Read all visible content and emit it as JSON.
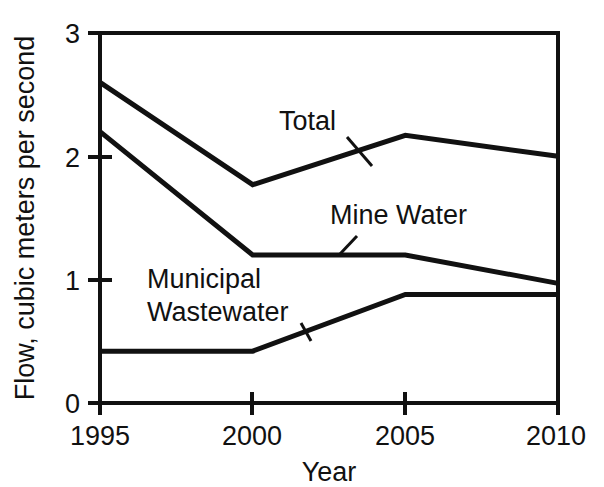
{
  "chart_data": {
    "type": "line",
    "title": "",
    "xlabel": "Year",
    "ylabel": "Flow, cubic meters per second",
    "x": [
      1995,
      2000,
      2005,
      2010
    ],
    "categories": [
      "1995",
      "2000",
      "2005",
      "2010"
    ],
    "xlim": [
      1995,
      2010
    ],
    "ylim": [
      0,
      3
    ],
    "xticks": [
      "1995",
      "2000",
      "2005",
      "2010"
    ],
    "yticks": [
      "0",
      "1",
      "2",
      "3"
    ],
    "grid": false,
    "legend_position": "inline-labels",
    "series": [
      {
        "name": "Total",
        "values": [
          2.6,
          1.77,
          2.17,
          2.0
        ]
      },
      {
        "name": "Mine Water",
        "values": [
          2.2,
          1.2,
          1.2,
          0.97
        ]
      },
      {
        "name": "Municipal Wastewater",
        "values": [
          0.42,
          0.42,
          0.88,
          0.88
        ]
      }
    ],
    "annotations": [
      {
        "text": "Total",
        "series": "Total"
      },
      {
        "text": "Mine Water",
        "series": "Mine Water"
      },
      {
        "text": "Municipal",
        "series": "Municipal Wastewater"
      },
      {
        "text": "Wastewater",
        "series": "Municipal Wastewater"
      }
    ],
    "colors": {
      "line": "#111111",
      "background": "#ffffff",
      "axis": "#111111"
    }
  },
  "axis": {
    "x_title": "Year",
    "y_title": "Flow, cubic meters per second",
    "x_tick_0": "1995",
    "x_tick_1": "2000",
    "x_tick_2": "2005",
    "x_tick_3": "2010",
    "y_tick_0": "0",
    "y_tick_1": "1",
    "y_tick_2": "2",
    "y_tick_3": "3"
  },
  "labels": {
    "total": "Total",
    "mine_water": "Mine Water",
    "municipal_line1": "Municipal",
    "municipal_line2": "Wastewater"
  }
}
